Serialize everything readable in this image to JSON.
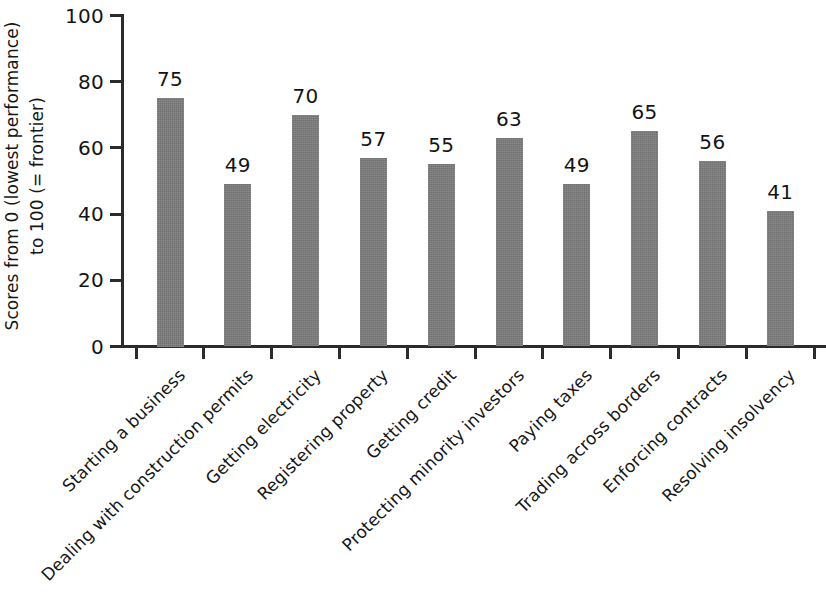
{
  "chart_data": {
    "type": "bar",
    "title": "",
    "subtitle": "",
    "xlabel": "",
    "ylabel": "Scores from 0 (lowest performance) to 100 (= frontier)",
    "ylabel_line1": "Scores from 0 (lowest performance)",
    "ylabel_line2": "to 100 (= frontier)",
    "ylim": [
      0,
      100
    ],
    "yticks": [
      0,
      20,
      40,
      60,
      80,
      100
    ],
    "ytick_labels": [
      "0",
      "20",
      "40",
      "60",
      "80",
      "100"
    ],
    "grid": false,
    "legend": false,
    "bar_color": "#7b7b7b",
    "axis_color": "#2b2b2b",
    "text_color": "#141414",
    "background_color": "#ffffff",
    "categories": [
      "Starting a business",
      "Dealing with construction permits",
      "Getting electricity",
      "Registering property",
      "Getting credit",
      "Protecting minority investors",
      "Paying taxes",
      "Trading across borders",
      "Enforcing contracts",
      "Resolving insolvency"
    ],
    "values": [
      75,
      49,
      70,
      57,
      55,
      63,
      49,
      65,
      56,
      41
    ],
    "value_labels": [
      "75",
      "49",
      "70",
      "57",
      "55",
      "63",
      "49",
      "65",
      "56",
      "41"
    ]
  }
}
